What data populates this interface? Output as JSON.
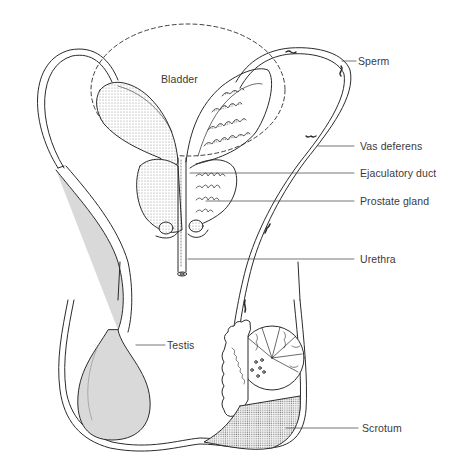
{
  "diagram": {
    "labels": {
      "bladder": "Bladder",
      "sperm": "Sperm",
      "vas_deferens": "Vas deferens",
      "ejaculatory_duct": "Ejaculatory duct",
      "prostate_gland": "Prostate gland",
      "urethra": "Urethra",
      "testis": "Testis",
      "scrotum": "Scrotum"
    },
    "colors": {
      "ink": "#2b2b2b",
      "stipple": "#bdbdbd",
      "stipple_dark": "#9a9a9a",
      "background": "#ffffff",
      "label_text": "#3a3a3a"
    }
  }
}
